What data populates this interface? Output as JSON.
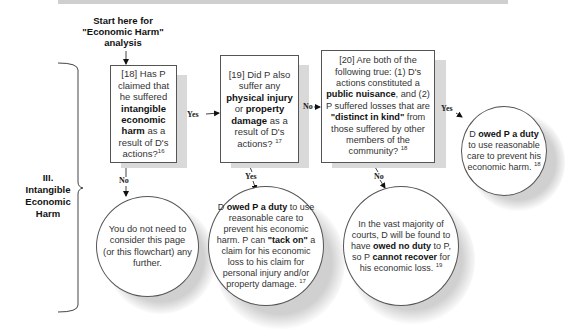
{
  "start_label": [
    "Start here for",
    "\"Economic Harm\"",
    "analysis"
  ],
  "section": {
    "numeral": "III.",
    "lines": [
      "Intangible",
      "Economic",
      "Harm"
    ]
  },
  "nodes": {
    "q18": {
      "pre": "[18] Has P claimed that he suffered ",
      "bold": "intangible economic harm",
      "post": " as a result of D's actions?",
      "note": "16"
    },
    "q19": {
      "pre": "[19] Did P also suffer any ",
      "bold1": "physical injury",
      "mid": " or ",
      "bold2": "property damage",
      "post": " as a result of D's actions?",
      "note": "17"
    },
    "q20": {
      "pre": "[20] Are both of the following true: (1) D's actions constituted a ",
      "bold1": "public nuisance",
      "mid": ", and (2) P suffered losses that are ",
      "bold2": "\"distinct in kind\"",
      "post": " from those suffered by other members of the community?",
      "note": "18"
    },
    "r18_no": {
      "text": "You do not need to consider this page (or this flowchart) any further."
    },
    "r19_yes": {
      "pre": "D ",
      "bold1": "owed P a duty",
      "mid": " to use reasonable care to prevent his economic harm. P can ",
      "bold2": "\"tack on\"",
      "post": " a claim for his economic loss to his claim for personal injury and/or property damage.",
      "note": "17"
    },
    "r20_no": {
      "pre": "In the vast majority of courts, D will be found to have ",
      "bold1": "owed no duty",
      "mid": " to P, so P ",
      "bold2": "cannot recover",
      "post": " for his economic loss.",
      "note": "19"
    },
    "r20_yes": {
      "pre": "D ",
      "bold1": "owed P a duty",
      "post": " to use reasonable care to prevent his economic harm.",
      "note": "18"
    }
  },
  "edges": {
    "e18_yes": "Yes",
    "e18_no": "No",
    "e19_no": "No",
    "e19_yes": "Yes",
    "e20_yes": "Yes",
    "e20_no": "No"
  }
}
